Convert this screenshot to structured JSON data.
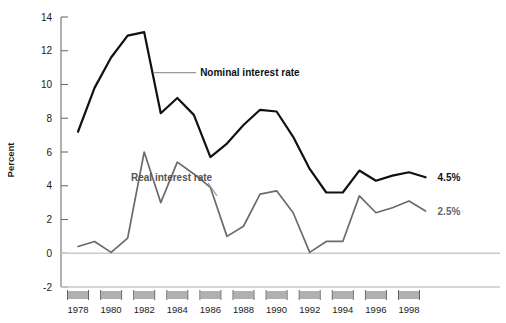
{
  "chart_data": {
    "type": "line",
    "title": "",
    "xlabel": "",
    "ylabel": "Percent",
    "ylim": [
      -2,
      14
    ],
    "xlim": [
      1978,
      1999
    ],
    "grid": false,
    "zero_line": true,
    "legend_position": "inline-annotations",
    "y_ticks": [
      14,
      12,
      10,
      8,
      6,
      4,
      2,
      0,
      -2
    ],
    "y_tick_labels": [
      "14",
      "12",
      "10",
      "8",
      "6",
      "4",
      "2",
      "0",
      "-2"
    ],
    "x_ticks": [
      1978,
      1980,
      1982,
      1984,
      1986,
      1988,
      1990,
      1992,
      1994,
      1996,
      1998
    ],
    "x_tick_labels": [
      "1978",
      "1980",
      "1982",
      "1984",
      "1986",
      "1988",
      "1990",
      "1992",
      "1994",
      "1996",
      "1998"
    ],
    "x": [
      1978,
      1979,
      1980,
      1981,
      1982,
      1983,
      1984,
      1985,
      1986,
      1987,
      1988,
      1989,
      1990,
      1991,
      1992,
      1993,
      1994,
      1995,
      1996,
      1997,
      1998,
      1999
    ],
    "series": [
      {
        "name": "Nominal interest rate",
        "color": "#111111",
        "values": [
          7.2,
          9.8,
          11.6,
          12.9,
          13.1,
          8.3,
          9.2,
          8.2,
          5.7,
          6.5,
          7.6,
          8.5,
          8.4,
          6.9,
          5.0,
          3.6,
          3.6,
          4.9,
          4.3,
          4.6,
          4.8,
          4.5
        ]
      },
      {
        "name": "Real interest rate",
        "color": "#6b6b6b",
        "values": [
          0.4,
          0.7,
          0.05,
          0.9,
          6.0,
          3.0,
          5.4,
          4.7,
          3.9,
          1.0,
          1.6,
          3.5,
          3.7,
          2.4,
          0.05,
          0.7,
          0.7,
          3.4,
          2.4,
          2.7,
          3.1,
          2.5
        ]
      }
    ],
    "annotations": [
      {
        "name": "nominal-series-label",
        "text": "Nominal interest rate",
        "target_x": 1982.6,
        "target_y": 10.7
      },
      {
        "name": "real-series-label",
        "text": "Real interest rate",
        "target_x": 1986.4,
        "target_y": 3.4
      }
    ],
    "end_labels": [
      {
        "name": "nominal-end-value",
        "text": "4.5%",
        "value": 4.5
      },
      {
        "name": "real-end-value",
        "text": "2.5%",
        "value": 2.5
      }
    ]
  },
  "axis": {
    "y_title": "Percent"
  },
  "colors": {
    "nominal": "#111111",
    "real": "#6b6b6b",
    "zero_line": "#c9c9c9",
    "axis": "#6e6e6e",
    "tick_box": "#b0b0b0",
    "background": "#ffffff"
  }
}
